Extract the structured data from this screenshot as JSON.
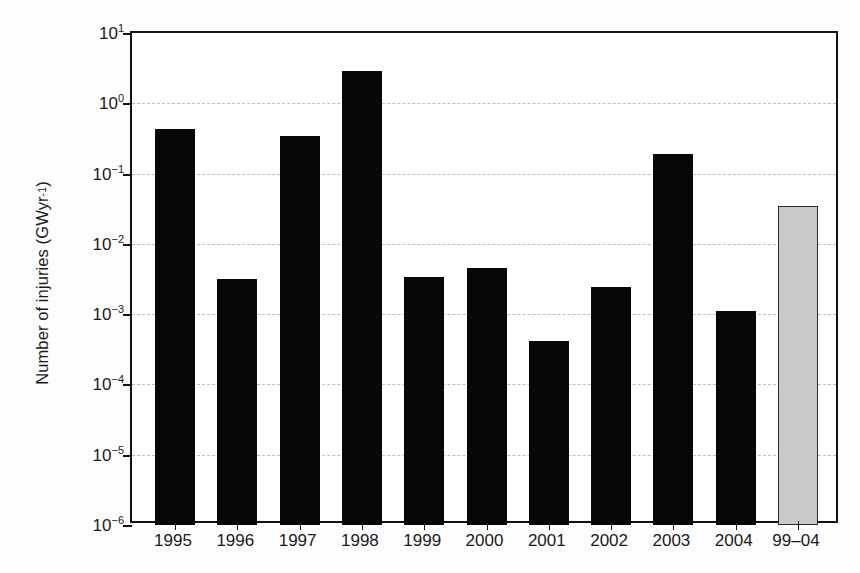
{
  "chart_data": {
    "type": "bar",
    "title": "",
    "xlabel": "",
    "ylabel": "Number of injuries (GWyr⁻¹)",
    "ylabel_text": "Number of injuries (GWyr",
    "ylabel_exponent": "-1",
    "ylabel_close": ")",
    "yscale": "log",
    "ylim": [
      1e-06,
      10
    ],
    "grid": "horizontal-dashed",
    "legend": "none",
    "categories": [
      "1995",
      "1996",
      "1997",
      "1998",
      "1999",
      "2000",
      "2001",
      "2002",
      "2003",
      "2004",
      "99–04"
    ],
    "values": [
      0.43,
      0.0032,
      0.34,
      2.9,
      0.0034,
      0.0046,
      0.00042,
      0.0024,
      0.19,
      0.0011,
      0.035
    ],
    "bar_styles": [
      "black",
      "black",
      "black",
      "black",
      "black",
      "black",
      "black",
      "black",
      "black",
      "black",
      "gray-highlight"
    ],
    "ytick_mantissa": [
      "10",
      "10",
      "10",
      "10",
      "10",
      "10",
      "10",
      "10"
    ],
    "ytick_exponents": [
      "1",
      "0",
      "-1",
      "-2",
      "-3",
      "-4",
      "-5",
      "-6"
    ],
    "ytick_values": [
      10,
      1,
      0.1,
      0.01,
      0.001,
      0.0001,
      1e-05,
      1e-06
    ],
    "colors": {
      "bar_black": "#080808",
      "bar_gray": "#c9c9c9",
      "bar_gray_border": "#2a2a2a",
      "axis": "#111111",
      "grid": "#b9bfc4",
      "text": "#1a1a1a",
      "background": "#ffffff"
    }
  }
}
